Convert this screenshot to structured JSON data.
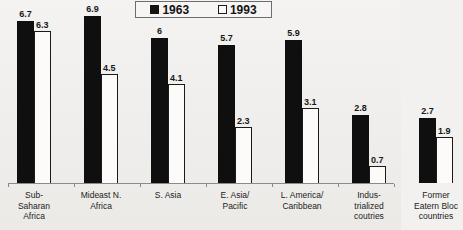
{
  "legend": {
    "entries": [
      {
        "label": "1963",
        "swatch": "filled-square-icon"
      },
      {
        "label": "1993",
        "swatch": "hollow-square-icon"
      }
    ]
  },
  "chart_data": {
    "type": "bar",
    "title": "",
    "xlabel": "",
    "ylabel": "",
    "ylim": [
      0,
      7
    ],
    "grid": false,
    "legend_position": "top-center",
    "categories": [
      "Sub-\nSaharan\nAfrica",
      "Mideast N.\nAfrica",
      "S. Asia",
      "E. Asia/\nPacific",
      "L. America/\nCaribbean",
      "Indus-\ntrialized\ncoutries",
      "Former\nEatern Bloc\ncountries"
    ],
    "series": [
      {
        "name": "1963",
        "values": [
          6.7,
          6.9,
          6,
          5.7,
          5.9,
          2.8,
          2.7
        ],
        "labels": [
          "6.7",
          "6.9",
          "6",
          "5.7",
          "5.9",
          "2.8",
          "2.7"
        ],
        "color": "#0f0f0f",
        "style": "filled"
      },
      {
        "name": "1993",
        "values": [
          6.3,
          4.5,
          4.1,
          2.3,
          3.1,
          0.7,
          1.9
        ],
        "labels": [
          "6.3",
          "4.5",
          "4.1",
          "2.3",
          "3.1",
          "0.7",
          "1.9"
        ],
        "color": "#fcfbfa",
        "style": "outlined"
      }
    ]
  },
  "geometry": {
    "baseline_y": 183,
    "px_per_unit": 24.2,
    "bar_width": 17,
    "group_left": [
      17,
      85,
      152,
      220,
      287,
      355,
      422
    ],
    "group_x": [
      17,
      84,
      151,
      218,
      285,
      352,
      419
    ],
    "tick_x": [
      8,
      74,
      140,
      206,
      272,
      338,
      394
    ],
    "cat_centers": [
      34,
      101,
      168,
      235,
      302,
      369,
      386
    ]
  }
}
